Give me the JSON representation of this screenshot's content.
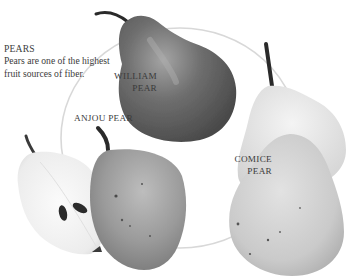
{
  "caption": {
    "title": "PEARS",
    "body": "Pears are one of the highest fruit sources of fiber."
  },
  "labels": {
    "william": {
      "line1": "WILLIAM",
      "line2": "PEAR"
    },
    "anjou": {
      "line1": "ANJOU PEAR"
    },
    "comice": {
      "line1": "COMICE",
      "line2": "PEAR"
    }
  },
  "colors": {
    "background": "#ffffff",
    "circle_outline": "#d8d8d8",
    "william_pear": "#6e6e6e",
    "anjou_pear": "#9a9a9a",
    "comice_pear": "#d2d2d2",
    "cut_pear_flesh": "#f2f2f2",
    "stem": "#2a2a2a",
    "text": "#3a3a3a"
  }
}
